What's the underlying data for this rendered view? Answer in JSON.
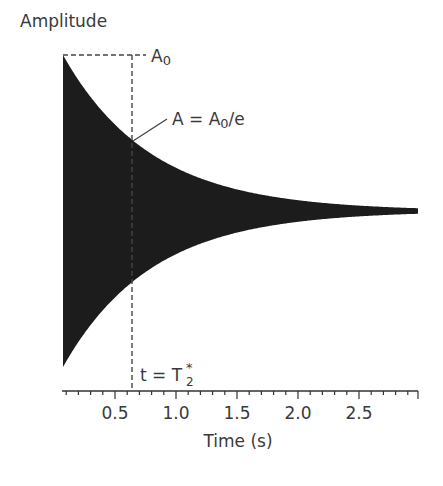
{
  "chart_data": {
    "type": "area",
    "title": "",
    "ylabel": "Amplitude",
    "xlabel": "Time (s)",
    "xlim": [
      0.066,
      2.98
    ],
    "x_ticks": [
      0.5,
      1.0,
      1.5,
      2.0,
      2.5
    ],
    "x_tick_labels": [
      "0.5",
      "1.0",
      "1.5",
      "2.0",
      "2.5"
    ],
    "minor_tick_step": 0.1,
    "grid": false,
    "legend": null,
    "series": [
      {
        "name": "FID envelope (decaying oscillation)",
        "description": "Exponentially decaying signal filled between +A(t) and -A(t)",
        "x": [
          0.07,
          0.3,
          0.57,
          0.8,
          1.0,
          1.2,
          1.5,
          2.0,
          2.5,
          2.98
        ],
        "upper": [
          1.0,
          0.74,
          0.45,
          0.29,
          0.22,
          0.16,
          0.11,
          0.05,
          0.02,
          0.005
        ],
        "lower": [
          -1.0,
          -0.74,
          -0.45,
          -0.29,
          -0.22,
          -0.16,
          -0.11,
          -0.05,
          -0.02,
          -0.005
        ],
        "color": "#1a1a1a"
      }
    ],
    "annotations": [
      {
        "text_main": "A",
        "text_sub": "0",
        "meaning": "initial amplitude A0",
        "y_rel": 1.0
      },
      {
        "text_main": "A = A",
        "text_sub": "0",
        "text_tail": "/e",
        "meaning": "amplitude at T2*",
        "y_rel": 0.37
      },
      {
        "text_main": "t = T",
        "text_sub": "2",
        "text_sup": "*",
        "meaning": "time T2*",
        "x": 0.64
      }
    ]
  },
  "labels": {
    "ylabel": "Amplitude",
    "xlabel": "Time (s)",
    "a0_main": "A",
    "a0_sub": "0",
    "ae_main": "A = A",
    "ae_sub": "0",
    "ae_tail": "/e",
    "t2_main": "t = T",
    "t2_sub": "2",
    "t2_sup": "*",
    "ticks": [
      "0.5",
      "1.0",
      "1.5",
      "2.0",
      "2.5"
    ]
  }
}
